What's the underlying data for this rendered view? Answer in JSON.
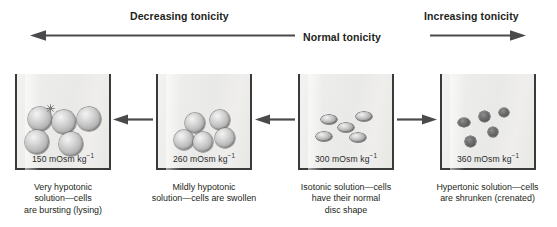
{
  "axis": {
    "decreasing_label": "Decreasing tonicity",
    "normal_label": "Normal tonicity",
    "increasing_label": "Increasing tonicity"
  },
  "beakers": [
    {
      "id": "very-hypotonic",
      "osmolality": "150 mOsm kg",
      "osmolality_exponent": "−1",
      "cell_type": "round-bursting",
      "cell_count": 5,
      "caption_lines": [
        "Very hypotonic",
        "solution—cells",
        "are bursting (lysing)"
      ]
    },
    {
      "id": "mildly-hypotonic",
      "osmolality": "260 mOsm kg",
      "osmolality_exponent": "−1",
      "cell_type": "round-swollen",
      "cell_count": 5,
      "caption_lines": [
        "Mildly hypotonic",
        "solution—cells are swollen"
      ]
    },
    {
      "id": "isotonic",
      "osmolality": "300 mOsm kg",
      "osmolality_exponent": "−1",
      "cell_type": "disc-normal",
      "cell_count": 5,
      "caption_lines": [
        "Isotonic solution—cells",
        "have their normal",
        "disc shape"
      ]
    },
    {
      "id": "hypertonic",
      "osmolality": "360 mOsm kg",
      "osmolality_exponent": "−1",
      "cell_type": "crenated-shrunken",
      "cell_count": 5,
      "caption_lines": [
        "Hypertonic solution—cells",
        "are shrunken (crenated)"
      ]
    }
  ],
  "colors": {
    "ink": "#231f20",
    "arrow": "#4a4a4c",
    "beaker_wall": "#3a3a3c",
    "beaker_fill": "#ececea",
    "cell_light": "#c2c2c2",
    "cell_dark": "#585858"
  }
}
